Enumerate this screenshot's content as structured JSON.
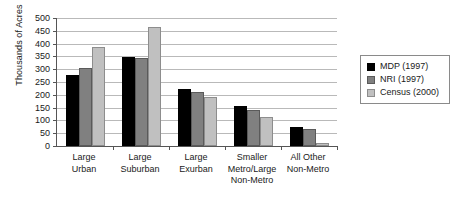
{
  "chart_data": {
    "type": "bar",
    "title": "",
    "subtitle": "",
    "xlabel": "",
    "ylabel": "Thousands of Acres",
    "ylim": [
      0,
      500
    ],
    "ytick_step": 50,
    "yticks": [
      0,
      50,
      100,
      150,
      200,
      250,
      300,
      350,
      400,
      450,
      500
    ],
    "ytick_labels": [
      "0",
      "50",
      "100",
      "150",
      "200",
      "250",
      "300",
      "350",
      "400",
      "450",
      "500"
    ],
    "grid": "horizontal",
    "legend_position": "right",
    "categories": [
      "Large\nUrban",
      "Large\nSuburban",
      "Large\nExurban",
      "Smaller\nMetro/Large\nNon-Metro",
      "All Other\nNon-Metro"
    ],
    "series": [
      {
        "name": "MDP (1997)",
        "color": "#000000",
        "values": [
          278,
          346,
          224,
          157,
          74
        ]
      },
      {
        "name": "NRI (1997)",
        "color": "#808080",
        "values": [
          306,
          342,
          211,
          142,
          67
        ]
      },
      {
        "name": "Census (2000)",
        "color": "#c0c0c0",
        "values": [
          385,
          466,
          192,
          114,
          12
        ]
      }
    ]
  },
  "legend": {
    "entries": [
      {
        "label": "MDP (1997)"
      },
      {
        "label": "NRI (1997)"
      },
      {
        "label": "Census (2000)"
      }
    ]
  }
}
